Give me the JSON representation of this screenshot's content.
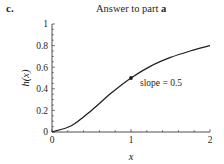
{
  "panel_label": "c.",
  "title_prefix": "Answer to part ",
  "title_bold": "a",
  "chart_data": {
    "type": "line",
    "title": "Answer to part a",
    "xlabel": "x",
    "ylabel": "h(x)",
    "xlim": [
      0,
      2
    ],
    "ylim": [
      0,
      1
    ],
    "xticks": [
      "0",
      "1",
      "2"
    ],
    "yticks": [
      "0",
      "0.2",
      "0.4",
      "0.6",
      "0.8",
      "1"
    ],
    "series": [
      {
        "name": "h(x)",
        "x": [
          0,
          0.25,
          0.5,
          0.75,
          1.0,
          1.25,
          1.5,
          1.75,
          2.0
        ],
        "values": [
          0,
          0.06,
          0.2,
          0.36,
          0.5,
          0.61,
          0.69,
          0.75,
          0.8
        ]
      }
    ],
    "marked_point": {
      "x": 1,
      "y": 0.5
    },
    "annotations": [
      {
        "text": "slope = 0.5",
        "x": 1,
        "y": 0.5
      }
    ],
    "grid": false,
    "legend": null
  }
}
